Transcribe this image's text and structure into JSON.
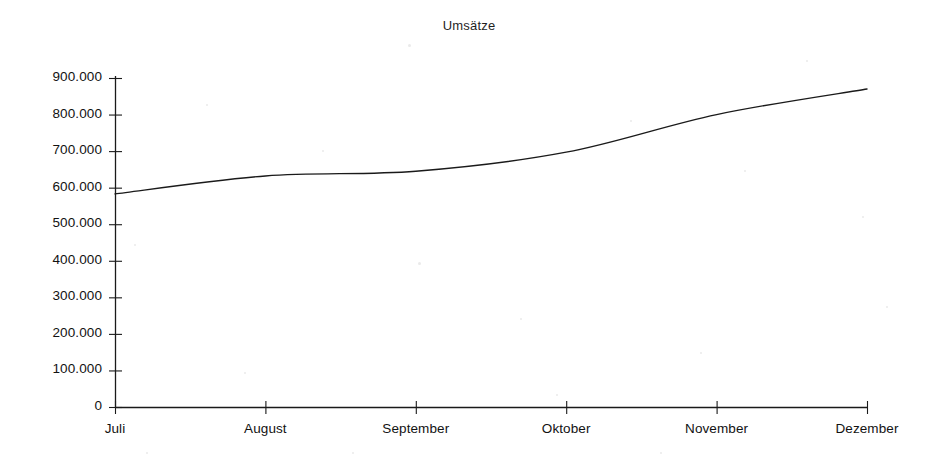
{
  "chart_data": {
    "type": "line",
    "title": "Umsätze",
    "xlabel": "",
    "ylabel": "",
    "categories": [
      "Juli",
      "August",
      "September",
      "Oktober",
      "November",
      "Dezember"
    ],
    "values": [
      583000,
      632000,
      645000,
      697000,
      800000,
      870000
    ],
    "series": [
      {
        "name": "Umsätze",
        "values": [
          583000,
          632000,
          645000,
          697000,
          800000,
          870000
        ]
      }
    ],
    "ylim": [
      0,
      900000
    ],
    "ytick_step": 100000,
    "ytick_labels": [
      "900.000",
      "800.000",
      "700.000",
      "600.000",
      "500.000",
      "400.000",
      "300.000",
      "200.000",
      "100.000",
      "0"
    ],
    "ytick_values": [
      900000,
      800000,
      700000,
      600000,
      500000,
      400000,
      300000,
      200000,
      100000,
      0
    ],
    "grid": false,
    "legend": false,
    "legend_position": "none",
    "line_color": "#1a1a1a",
    "background_color": "#ffffff",
    "markers": false,
    "smoothed": true
  },
  "axes": {
    "y_axis_name": "y-axis",
    "x_axis_name": "x-axis"
  }
}
